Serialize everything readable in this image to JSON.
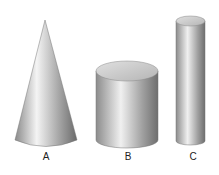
{
  "figure": {
    "shapes": [
      {
        "id": "A",
        "label": "A",
        "type": "cone"
      },
      {
        "id": "B",
        "label": "B",
        "type": "cylinder-wide"
      },
      {
        "id": "C",
        "label": "C",
        "type": "cylinder-tall-narrow"
      }
    ],
    "colors": {
      "background": "#ffffff",
      "shade_dark": "#6f6f6f",
      "shade_light": "#f2f2f2",
      "top": "#c9c9c9"
    }
  }
}
